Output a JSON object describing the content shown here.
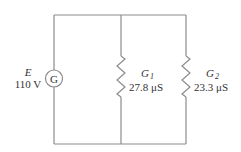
{
  "diagram": {
    "type": "parallel-circuit",
    "wire_color": "#8c8c8c",
    "text_color": "#333333",
    "source": {
      "symbol": "G",
      "name": "E",
      "value": "110 V"
    },
    "branches": [
      {
        "name": "G",
        "subscript": "1",
        "value": "27.8 μS"
      },
      {
        "name": "G",
        "subscript": "2",
        "value": "23.3 μS"
      }
    ]
  }
}
